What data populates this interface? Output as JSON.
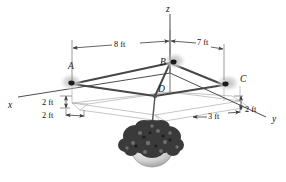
{
  "figure": {
    "axes": [
      {
        "id": "x",
        "label": "x"
      },
      {
        "id": "y",
        "label": "y"
      },
      {
        "id": "z",
        "label": "z"
      }
    ],
    "points": [
      {
        "id": "A",
        "label": "A",
        "kind": "ceiling-anchor"
      },
      {
        "id": "B",
        "label": "B",
        "kind": "ceiling-anchor"
      },
      {
        "id": "C",
        "label": "C",
        "kind": "ceiling-anchor"
      },
      {
        "id": "D",
        "label": "D",
        "kind": "cord-junction"
      }
    ],
    "dimensions": [
      {
        "id": "ab-span",
        "label": "8 ft",
        "orientation": "horizontal"
      },
      {
        "id": "bc-span",
        "label": "7 ft",
        "orientation": "horizontal"
      },
      {
        "id": "a-drop",
        "label": "2 ft",
        "orientation": "vertical"
      },
      {
        "id": "a-offset",
        "label": "2 ft",
        "orientation": "horizontal"
      },
      {
        "id": "c-offset",
        "label": "3 ft",
        "orientation": "horizontal"
      },
      {
        "id": "c-drop",
        "label": "2 ft",
        "orientation": "vertical"
      }
    ],
    "object": {
      "name": "hanging-plant",
      "parts": [
        "foliage",
        "pot",
        "suspension-cord"
      ]
    },
    "colors": {
      "cord": "#474747",
      "axis": "#4d4d4d",
      "grid": "#aeaeae",
      "anchor_glow": "#cfcfcf",
      "anchor_dot": "#1a1a1a",
      "foliage": "#3a3a3a",
      "pot": "#c9c9c9",
      "text": "#111111",
      "background": "#ffffff"
    }
  }
}
